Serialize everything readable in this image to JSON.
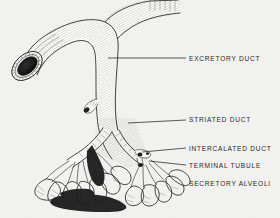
{
  "figure": {
    "background_color": "#f2f2f0",
    "ink_color": "#1c1c1c",
    "style": "black-and-white engraved line drawing"
  },
  "labels": [
    {
      "id": "excretory-duct",
      "text": "EXCRETORY DUCT",
      "x": 189,
      "y": 59,
      "leader": {
        "x1": 108,
        "y1": 58,
        "x2": 186,
        "y2": 58,
        "visible": true
      }
    },
    {
      "id": "striated-duct",
      "text": "STRIATED DUCT",
      "x": 189,
      "y": 120,
      "leader": {
        "x1": 128,
        "y1": 123,
        "x2": 186,
        "y2": 120,
        "visible": true
      }
    },
    {
      "id": "intercalated-duct",
      "text": "INTERCALATED DUCT",
      "x": 189,
      "y": 149,
      "leader": {
        "x1": 142,
        "y1": 152,
        "x2": 186,
        "y2": 149,
        "visible": true
      }
    },
    {
      "id": "terminal-tubule",
      "text": "TERMINAL TUBULE",
      "x": 189,
      "y": 167,
      "leader": {
        "x1": 149,
        "y1": 161,
        "x2": 186,
        "y2": 166,
        "visible": true
      }
    },
    {
      "id": "secretory-alveoli",
      "text": "SECRETORY ALVEOLI",
      "x": 189,
      "y": 184,
      "leader": {
        "x1": 0,
        "y1": 0,
        "x2": 0,
        "y2": 0,
        "visible": false
      }
    }
  ],
  "structures": [
    {
      "id": "cut-duct-opening",
      "description": "cut end of excretory duct showing dark lumen",
      "cx": 27,
      "cy": 66
    },
    {
      "id": "main-trunk",
      "description": "large excretory duct curving from upper left"
    },
    {
      "id": "upper-branch",
      "description": "second excretory duct branch cut at top edge"
    },
    {
      "id": "side-stub",
      "description": "small cut side branch on left of striated duct",
      "cx": 95,
      "cy": 106
    },
    {
      "id": "left-alveoli-cluster",
      "description": "dense cluster of secretory alveoli, heavily shaded"
    },
    {
      "id": "right-alveoli-cluster",
      "description": "open cluster of secretory alveoli, outlined"
    }
  ]
}
